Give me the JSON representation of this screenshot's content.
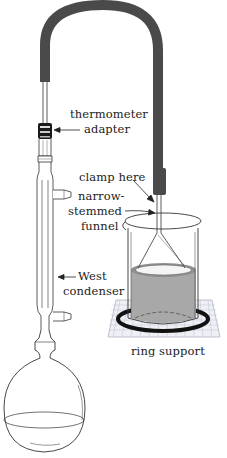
{
  "figure": {
    "labels": {
      "thermometer_adapter": [
        "thermometer",
        "adapter"
      ],
      "clamp_here": "clamp here",
      "narrow_stemmed_funnel": [
        "narrow-",
        "stemmed",
        "funnel"
      ],
      "west_condenser": [
        "West",
        "condenser"
      ],
      "ring_support": "ring support"
    },
    "colors": {
      "tubing": "#4a4a4a",
      "liquid": "#a8a8a8",
      "glass_line": "#333333",
      "ring": "#111111",
      "gauze_grid": "#9aa0b0"
    }
  }
}
